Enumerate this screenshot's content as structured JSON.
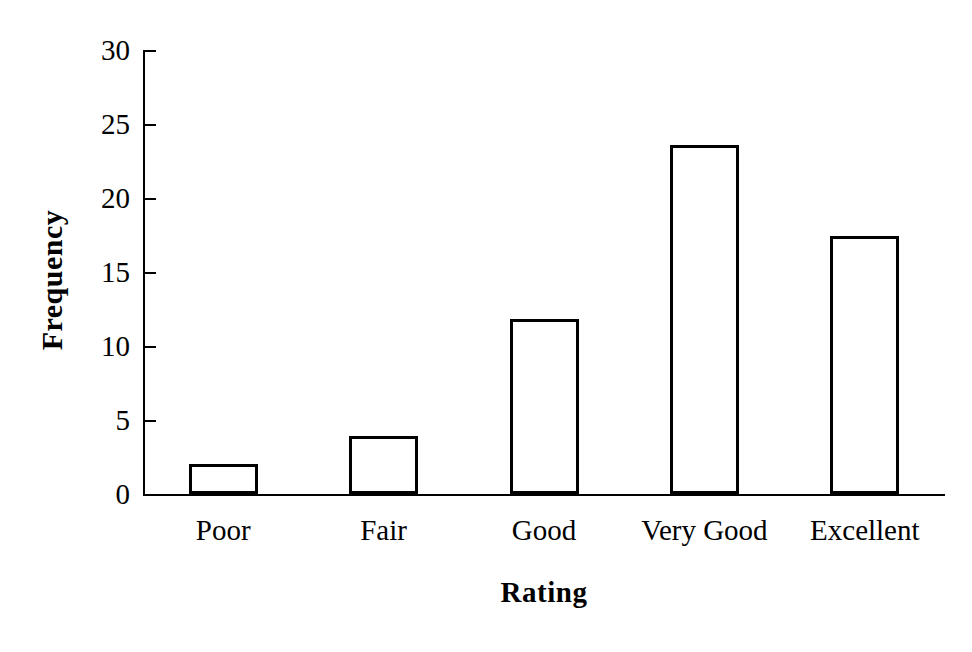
{
  "chart_data": {
    "type": "bar",
    "title": "",
    "xlabel": "Rating",
    "ylabel": "Frequency",
    "categories": [
      "Poor",
      "Fair",
      "Good",
      "Very Good",
      "Excellent"
    ],
    "values": [
      2.0,
      3.9,
      11.8,
      23.6,
      17.4
    ],
    "ylim": [
      0,
      30
    ],
    "yticks": [
      0,
      5,
      10,
      15,
      20,
      25,
      30
    ],
    "ytick_labels": [
      "0",
      "5",
      "10",
      "15",
      "20",
      "25",
      "30"
    ],
    "grid": false,
    "legend": null,
    "bar_fill_color": "#ffffff",
    "bar_edge_color": "#000000",
    "axis_color": "#000000",
    "background_color": "#ffffff"
  }
}
